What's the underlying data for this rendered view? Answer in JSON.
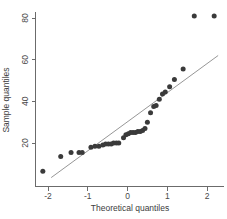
{
  "chart_data": {
    "type": "scatter",
    "title": "",
    "xlabel": "Theoretical quantiles",
    "ylabel": "Sample quantiles",
    "xlim": [
      -2.35,
      2.45
    ],
    "ylim": [
      2,
      86
    ],
    "xticks": [
      -2,
      -1,
      0,
      1,
      2
    ],
    "xtick_labels": [
      "-2",
      "-1",
      "0",
      "1",
      "2"
    ],
    "yticks": [
      20,
      40,
      60,
      80
    ],
    "ytick_labels": [
      "20",
      "40",
      "60",
      "80"
    ],
    "grid": false,
    "legend": "none",
    "series": [
      {
        "name": "Sample quantiles",
        "marker": "filled-circle",
        "color": "#3a3a3a",
        "points": [
          [
            -2.13,
            6.5
          ],
          [
            -1.68,
            13.5
          ],
          [
            -1.42,
            15.5
          ],
          [
            -1.22,
            15.5
          ],
          [
            -1.14,
            15.5
          ],
          [
            -0.92,
            18.0
          ],
          [
            -0.82,
            18.5
          ],
          [
            -0.72,
            18.5
          ],
          [
            -0.62,
            19.0
          ],
          [
            -0.55,
            19.5
          ],
          [
            -0.48,
            19.5
          ],
          [
            -0.41,
            19.5
          ],
          [
            -0.35,
            20.0
          ],
          [
            -0.28,
            20.0
          ],
          [
            -0.22,
            20.0
          ],
          [
            -0.1,
            22.5
          ],
          [
            -0.04,
            24.0
          ],
          [
            0.02,
            24.5
          ],
          [
            0.08,
            25.0
          ],
          [
            0.14,
            25.0
          ],
          [
            0.2,
            25.0
          ],
          [
            0.26,
            25.5
          ],
          [
            0.32,
            25.5
          ],
          [
            0.38,
            26.0
          ],
          [
            0.44,
            27.0
          ],
          [
            0.5,
            30.0
          ],
          [
            0.58,
            34.5
          ],
          [
            0.66,
            37.5
          ],
          [
            0.72,
            38.0
          ],
          [
            0.8,
            41.0
          ],
          [
            0.88,
            43.5
          ],
          [
            0.95,
            44.5
          ],
          [
            1.06,
            47.0
          ],
          [
            1.18,
            50.5
          ],
          [
            1.4,
            55.5
          ],
          [
            1.68,
            81.0
          ],
          [
            2.18,
            81.0
          ]
        ]
      }
    ],
    "reference_line": {
      "name": "qq-reference-line",
      "color": "#8a8a8a",
      "x_start": -1.92,
      "y_start": 3.4,
      "x_end": 2.28,
      "y_end": 62.0
    }
  }
}
